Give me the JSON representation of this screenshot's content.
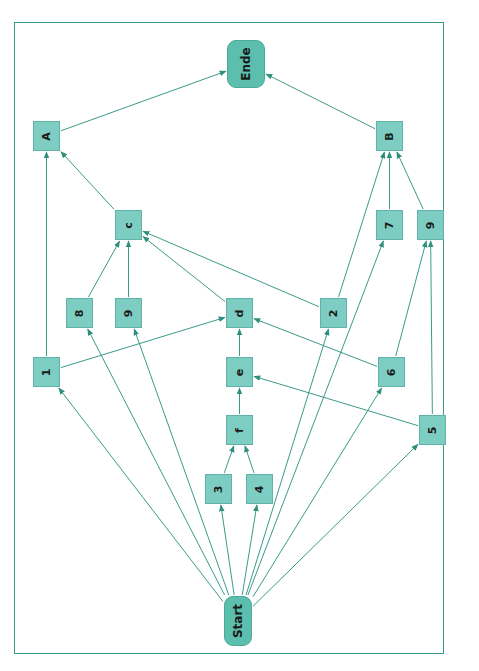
{
  "diagram": {
    "type": "activity-network",
    "orientation": "rotated-90",
    "colors": {
      "frame": "#3a9a88",
      "node_fill": "#7ecdc3",
      "terminal_fill": "#5cbfae",
      "edge": "#3a9a88"
    },
    "nodes": [
      {
        "id": "ende",
        "label": "Ende",
        "terminal": true,
        "x": 227,
        "y": 40,
        "w": 38,
        "h": 48
      },
      {
        "id": "start",
        "label": "Start",
        "terminal": true,
        "x": 224,
        "y": 596,
        "w": 28,
        "h": 50
      },
      {
        "id": "A",
        "label": "A",
        "x": 33,
        "y": 121,
        "w": 27,
        "h": 30
      },
      {
        "id": "B",
        "label": "B",
        "x": 376,
        "y": 121,
        "w": 27,
        "h": 30
      },
      {
        "id": "c",
        "label": "c",
        "x": 115,
        "y": 210,
        "w": 27,
        "h": 30
      },
      {
        "id": "n7",
        "label": "7",
        "x": 376,
        "y": 210,
        "w": 27,
        "h": 30
      },
      {
        "id": "n9top",
        "label": "9",
        "x": 417,
        "y": 210,
        "w": 27,
        "h": 30
      },
      {
        "id": "n8",
        "label": "8",
        "x": 66,
        "y": 298,
        "w": 27,
        "h": 30
      },
      {
        "id": "n9",
        "label": "9",
        "x": 115,
        "y": 298,
        "w": 27,
        "h": 30
      },
      {
        "id": "d",
        "label": "d",
        "x": 226,
        "y": 298,
        "w": 27,
        "h": 30
      },
      {
        "id": "n2",
        "label": "2",
        "x": 320,
        "y": 298,
        "w": 27,
        "h": 30
      },
      {
        "id": "n1",
        "label": "1",
        "x": 33,
        "y": 357,
        "w": 27,
        "h": 30
      },
      {
        "id": "e",
        "label": "e",
        "x": 226,
        "y": 357,
        "w": 27,
        "h": 30
      },
      {
        "id": "n6",
        "label": "6",
        "x": 378,
        "y": 357,
        "w": 27,
        "h": 30
      },
      {
        "id": "f",
        "label": "f",
        "x": 226,
        "y": 415,
        "w": 27,
        "h": 30
      },
      {
        "id": "n5",
        "label": "5",
        "x": 419,
        "y": 415,
        "w": 27,
        "h": 30
      },
      {
        "id": "n3",
        "label": "3",
        "x": 205,
        "y": 474,
        "w": 27,
        "h": 30
      },
      {
        "id": "n4",
        "label": "4",
        "x": 246,
        "y": 474,
        "w": 27,
        "h": 30
      }
    ],
    "edges": [
      [
        "start",
        "n1"
      ],
      [
        "start",
        "n8"
      ],
      [
        "start",
        "n9"
      ],
      [
        "start",
        "n3"
      ],
      [
        "start",
        "n4"
      ],
      [
        "start",
        "n2"
      ],
      [
        "start",
        "n7"
      ],
      [
        "start",
        "n6"
      ],
      [
        "start",
        "n5"
      ],
      [
        "n1",
        "A"
      ],
      [
        "n1",
        "d"
      ],
      [
        "n8",
        "c"
      ],
      [
        "n9",
        "c"
      ],
      [
        "d",
        "c"
      ],
      [
        "n2",
        "c"
      ],
      [
        "n2",
        "B"
      ],
      [
        "c",
        "A"
      ],
      [
        "A",
        "ende"
      ],
      [
        "B",
        "ende"
      ],
      [
        "n7",
        "B"
      ],
      [
        "n9top",
        "B"
      ],
      [
        "n6",
        "n9top"
      ],
      [
        "n5",
        "n9top"
      ],
      [
        "n6",
        "d"
      ],
      [
        "n5",
        "e"
      ],
      [
        "e",
        "d"
      ],
      [
        "f",
        "e"
      ],
      [
        "n3",
        "f"
      ],
      [
        "n4",
        "f"
      ]
    ]
  }
}
